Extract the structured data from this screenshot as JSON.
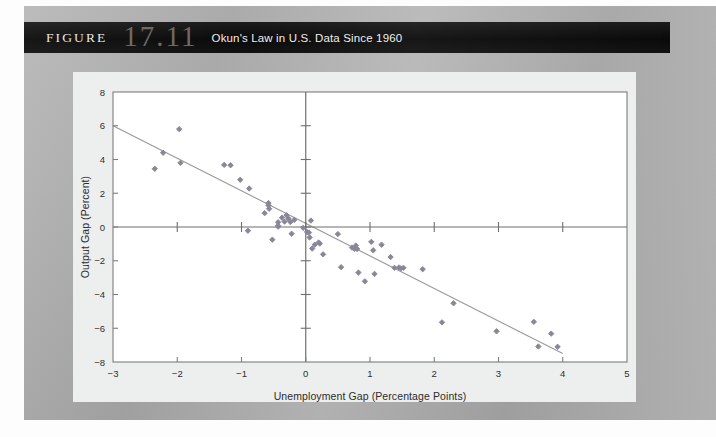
{
  "figure": {
    "label": "FIGURE",
    "number": "17.11",
    "caption": "Okun's Law in U.S. Data Since 1960"
  },
  "colors": {
    "title_bar_bg": "#0d0d0d",
    "title_text": "#ece9e4",
    "figure_number": "#6e6a64",
    "plot_bg": "#ffffff",
    "plate_bg": "#edeeee",
    "page_bg": "#b0b0b0",
    "point": "#8a8698",
    "trendline": "#9a9a9a",
    "axis": "#7d7d7d"
  },
  "chart_data": {
    "type": "scatter",
    "title": "Okun's Law in U.S. Data Since 1960",
    "xlabel": "Unemployment Gap (Percentage Points)",
    "ylabel": "Output Gap (Percent)",
    "xlim": [
      -3,
      5
    ],
    "ylim": [
      -8,
      8
    ],
    "xticks": [
      -3,
      -2,
      -1,
      0,
      1,
      2,
      3,
      4,
      5
    ],
    "yticks": [
      -8,
      -6,
      -4,
      -2,
      0,
      2,
      4,
      6,
      8
    ],
    "xtick_labels": [
      "−3",
      "−2",
      "−1",
      "0",
      "1",
      "2",
      "3",
      "4",
      "5"
    ],
    "ytick_labels": [
      "−8",
      "−6",
      "−4",
      "−2",
      "0",
      "2",
      "4",
      "6",
      "8"
    ],
    "grid": false,
    "legend": null,
    "series": [
      {
        "name": "U.S. annual observations since 1960",
        "marker": "diamond",
        "color": "#8a8698",
        "points": [
          [
            -2.35,
            3.45
          ],
          [
            -2.22,
            4.4
          ],
          [
            -1.97,
            5.8
          ],
          [
            -1.95,
            3.8
          ],
          [
            -1.27,
            3.68
          ],
          [
            -1.17,
            3.66
          ],
          [
            -1.02,
            2.8
          ],
          [
            -0.88,
            2.28
          ],
          [
            -0.9,
            -0.22
          ],
          [
            -0.64,
            0.82
          ],
          [
            -0.57,
            1.08
          ],
          [
            -0.58,
            1.42
          ],
          [
            -0.58,
            1.28
          ],
          [
            -0.52,
            -0.75
          ],
          [
            -0.43,
            0.28
          ],
          [
            -0.43,
            0.08
          ],
          [
            -0.43,
            0.02
          ],
          [
            -0.37,
            0.55
          ],
          [
            -0.33,
            0.32
          ],
          [
            -0.3,
            0.7
          ],
          [
            -0.27,
            0.5
          ],
          [
            -0.24,
            0.3
          ],
          [
            -0.22,
            -0.4
          ],
          [
            -0.18,
            0.42
          ],
          [
            -0.04,
            -0.05
          ],
          [
            0.02,
            -0.3
          ],
          [
            0.05,
            -0.33
          ],
          [
            0.06,
            -0.62
          ],
          [
            0.08,
            0.38
          ],
          [
            0.1,
            -1.28
          ],
          [
            0.14,
            -1.05
          ],
          [
            0.2,
            -0.92
          ],
          [
            0.22,
            -0.98
          ],
          [
            0.27,
            -1.62
          ],
          [
            0.5,
            -0.42
          ],
          [
            0.55,
            -2.38
          ],
          [
            0.72,
            -1.22
          ],
          [
            0.76,
            -1.3
          ],
          [
            0.78,
            -1.1
          ],
          [
            0.8,
            -1.3
          ],
          [
            0.82,
            -2.7
          ],
          [
            0.92,
            -3.22
          ],
          [
            1.02,
            -0.88
          ],
          [
            1.05,
            -1.38
          ],
          [
            1.07,
            -2.78
          ],
          [
            1.18,
            -1.05
          ],
          [
            1.32,
            -1.78
          ],
          [
            1.38,
            -2.42
          ],
          [
            1.45,
            -2.4
          ],
          [
            1.48,
            -2.45
          ],
          [
            1.52,
            -2.42
          ],
          [
            1.82,
            -2.5
          ],
          [
            2.12,
            -5.65
          ],
          [
            2.3,
            -4.52
          ],
          [
            2.97,
            -6.18
          ],
          [
            3.55,
            -5.62
          ],
          [
            3.62,
            -7.08
          ],
          [
            3.82,
            -6.32
          ],
          [
            3.92,
            -7.1
          ]
        ]
      }
    ],
    "trendline": {
      "name": "Okun's law fitted line",
      "color": "#9a9a9a",
      "x_start": -3.0,
      "y_start": 6.0,
      "x_end": 4.0,
      "y_end": -7.5,
      "slope": -1.93,
      "intercept": 0.21
    }
  }
}
